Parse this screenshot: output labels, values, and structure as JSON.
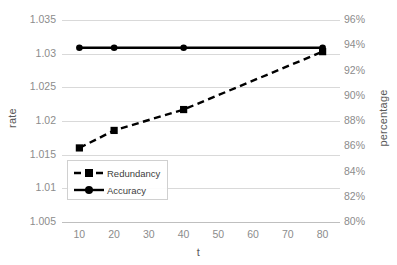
{
  "chart_data": {
    "type": "line",
    "title": "",
    "xlabel": "t",
    "ylabel": "rate",
    "y2label": "percentage",
    "x": [
      10,
      20,
      40,
      80
    ],
    "xticks": [
      "10",
      "20",
      "30",
      "40",
      "50",
      "60",
      "70",
      "80"
    ],
    "xlim": [
      5,
      85
    ],
    "ylim": [
      1.005,
      1.035
    ],
    "yticks": [
      "1.035",
      "1.03",
      "1.025",
      "1.02",
      "1.015",
      "1.01",
      "1.005"
    ],
    "y2lim": [
      80,
      96
    ],
    "y2ticks": [
      "96%",
      "94%",
      "92%",
      "90%",
      "88%",
      "86%",
      "84%",
      "82%",
      "80%"
    ],
    "grid": true,
    "legend_position": "lower-left-inside",
    "series": [
      {
        "name": "Redundancy",
        "axis": "left",
        "style": "dashed",
        "marker": "square",
        "color": "#000000",
        "values": [
          1.016,
          1.0186,
          1.0217,
          1.0303
        ]
      },
      {
        "name": "Accuracy",
        "axis": "right",
        "style": "solid",
        "marker": "circle",
        "color": "#000000",
        "values": [
          93.8,
          93.8,
          93.8,
          93.8
        ]
      }
    ]
  },
  "legend": {
    "items": [
      {
        "label": "Redundancy"
      },
      {
        "label": "Accuracy"
      }
    ]
  },
  "axes": {
    "left_title": "rate",
    "right_title": "percentage",
    "bottom_title": "t"
  }
}
